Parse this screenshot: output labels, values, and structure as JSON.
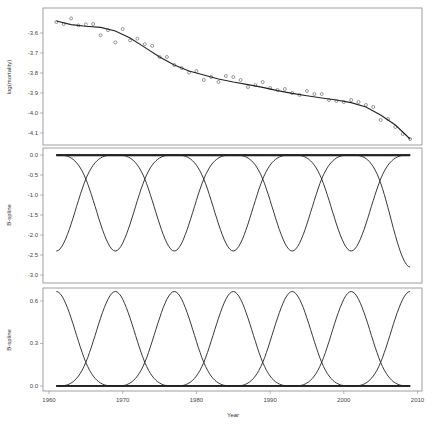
{
  "chart_data": [
    {
      "type": "scatter",
      "panel": "top",
      "title": "",
      "xlabel": "",
      "ylabel": "log(mortality)",
      "xlim": [
        1960,
        2010
      ],
      "ylim": [
        -4.15,
        -3.52
      ],
      "yticks": [
        -3.6,
        -3.7,
        -3.8,
        -3.9,
        -4.0,
        -4.1
      ],
      "ytick_labels": [
        "-3.6",
        "-3.7",
        "-3.8",
        "-3.9",
        "-4.0",
        "-4.1"
      ],
      "grid": false,
      "points": {
        "x": [
          1961,
          1962,
          1963,
          1964,
          1965,
          1966,
          1967,
          1968,
          1969,
          1970,
          1971,
          1972,
          1973,
          1974,
          1975,
          1976,
          1977,
          1978,
          1979,
          1980,
          1981,
          1982,
          1983,
          1984,
          1985,
          1986,
          1987,
          1988,
          1989,
          1990,
          1991,
          1992,
          1993,
          1994,
          1995,
          1996,
          1997,
          1998,
          1999,
          2000,
          2001,
          2002,
          2003,
          2004,
          2005,
          2006,
          2007,
          2008,
          2009
        ],
        "y": [
          -3.545,
          -3.555,
          -3.527,
          -3.562,
          -3.557,
          -3.555,
          -3.611,
          -3.586,
          -3.647,
          -3.58,
          -3.637,
          -3.628,
          -3.656,
          -3.664,
          -3.72,
          -3.72,
          -3.76,
          -3.775,
          -3.798,
          -3.79,
          -3.835,
          -3.82,
          -3.845,
          -3.815,
          -3.82,
          -3.835,
          -3.87,
          -3.86,
          -3.845,
          -3.875,
          -3.885,
          -3.88,
          -3.9,
          -3.91,
          -3.89,
          -3.905,
          -3.905,
          -3.935,
          -3.94,
          -3.945,
          -3.935,
          -3.945,
          -3.96,
          -3.97,
          -4.035,
          -4.03,
          -4.07,
          -4.105,
          -4.13
        ]
      },
      "fit_line": {
        "x": [
          1961,
          1963,
          1965,
          1967,
          1969,
          1971,
          1973,
          1975,
          1977,
          1979,
          1981,
          1983,
          1985,
          1987,
          1989,
          1991,
          1993,
          1995,
          1997,
          1999,
          2001,
          2003,
          2005,
          2007,
          2009
        ],
        "y": [
          -3.54,
          -3.558,
          -3.566,
          -3.572,
          -3.59,
          -3.625,
          -3.672,
          -3.72,
          -3.76,
          -3.79,
          -3.81,
          -3.83,
          -3.845,
          -3.858,
          -3.872,
          -3.888,
          -3.902,
          -3.914,
          -3.925,
          -3.935,
          -3.948,
          -3.97,
          -4.01,
          -4.06,
          -4.13
        ]
      }
    },
    {
      "type": "line",
      "panel": "middle",
      "title": "",
      "xlabel": "",
      "ylabel": "B-spline",
      "xlim": [
        1960,
        2010
      ],
      "ylim": [
        -3.15,
        0.1
      ],
      "yticks": [
        0.0,
        -0.5,
        -1.0,
        -1.5,
        -2.0,
        -2.5,
        -3.0
      ],
      "ytick_labels": [
        "0.0",
        "-0.5",
        "-1.0",
        "-1.5",
        "-2.0",
        "-2.5",
        "-3.0"
      ],
      "grid": false,
      "description": "Scaled (negative) B-spline basis functions, peaks (troughs) every 8 years",
      "series": [
        {
          "name": "basis-1",
          "peak_x": 1961,
          "trough": -2.4
        },
        {
          "name": "basis-2",
          "peak_x": 1969,
          "trough": -2.4
        },
        {
          "name": "basis-3",
          "peak_x": 1977,
          "trough": -2.4
        },
        {
          "name": "basis-4",
          "peak_x": 1985,
          "trough": -2.4
        },
        {
          "name": "basis-5",
          "peak_x": 1993,
          "trough": -2.4
        },
        {
          "name": "basis-6",
          "peak_x": 2001,
          "trough": -2.4
        },
        {
          "name": "basis-7",
          "peak_x": 2009,
          "trough": -2.8
        }
      ],
      "spacing_years": 8,
      "half_width_years": 8
    },
    {
      "type": "line",
      "panel": "bottom",
      "title": "",
      "xlabel": "Year",
      "ylabel": "B-spline",
      "xlim": [
        1960,
        2010
      ],
      "ylim": [
        -0.02,
        0.7
      ],
      "yticks": [
        0.0,
        0.3,
        0.6
      ],
      "ytick_labels": [
        "0.0",
        "0.3",
        "0.6"
      ],
      "xticks": [
        1960,
        1970,
        1980,
        1990,
        2000,
        2010
      ],
      "xtick_labels": [
        "1960",
        "1970",
        "1980",
        "1990",
        "2000",
        "2010"
      ],
      "grid": false,
      "description": "Cubic B-spline basis functions, peaks every 8 years",
      "series": [
        {
          "name": "basis-1",
          "peak_x": 1961,
          "peak": 0.667
        },
        {
          "name": "basis-2",
          "peak_x": 1969,
          "peak": 0.667
        },
        {
          "name": "basis-3",
          "peak_x": 1977,
          "peak": 0.667
        },
        {
          "name": "basis-4",
          "peak_x": 1985,
          "peak": 0.667
        },
        {
          "name": "basis-5",
          "peak_x": 1993,
          "peak": 0.667
        },
        {
          "name": "basis-6",
          "peak_x": 2001,
          "peak": 0.667
        },
        {
          "name": "basis-7",
          "peak_x": 2009,
          "peak": 0.667
        }
      ],
      "spacing_years": 8
    }
  ],
  "labels": {
    "x_axis_title": "Year",
    "top_y_title": "log(mortality)",
    "middle_y_title": "B-spline",
    "bottom_y_title": "B-spline"
  },
  "colors": {
    "line": "#222222",
    "frame": "#888888",
    "points": "#555555"
  }
}
